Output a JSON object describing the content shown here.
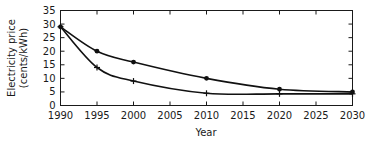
{
  "chart_data": {
    "type": "line",
    "title": "",
    "subtitle": "",
    "xlabel": "Year",
    "ylabel": "Electricity price (cents/kWh)",
    "ylabel_line1": "Electricity price",
    "ylabel_line2": "(cents/kWh)",
    "xlim": [
      1990,
      2030
    ],
    "ylim": [
      0,
      35
    ],
    "grid": false,
    "legend": "none",
    "x_ticks": [
      1990,
      1995,
      2000,
      2005,
      2010,
      2015,
      2020,
      2025,
      2030
    ],
    "x_tick_labels": [
      "1990",
      "1995",
      "2000",
      "2005",
      "2010",
      "2015",
      "2020",
      "2025",
      "2030"
    ],
    "y_ticks": [
      0,
      5,
      10,
      15,
      20,
      25,
      30,
      35
    ],
    "y_tick_labels": [
      "0",
      "5",
      "10",
      "15",
      "20",
      "25",
      "30",
      "35"
    ],
    "series": [
      {
        "name": "upper-curve",
        "marker": "circle",
        "x": [
          1990,
          1995,
          2000,
          2010,
          2020,
          2030
        ],
        "values": [
          29,
          20,
          16,
          10,
          6,
          5
        ]
      },
      {
        "name": "lower-curve",
        "marker": "plus",
        "x": [
          1990,
          1995,
          2000,
          2010,
          2020,
          2030
        ],
        "values": [
          29,
          14,
          9,
          4.5,
          4.3,
          4.3
        ]
      }
    ],
    "colors": {
      "line": "#111111",
      "axis": "#1a1a1a",
      "background": "#ffffff"
    }
  }
}
